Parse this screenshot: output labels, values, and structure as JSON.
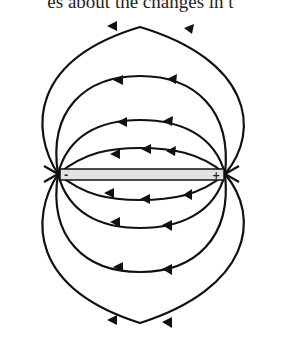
{
  "caption_fragment": "es about the changes in t",
  "diagram": {
    "type": "electric dipole field lines",
    "negative_label": "-",
    "positive_label": "+",
    "colors": {
      "line": "#111111",
      "bar_fill": "#e3e3e3"
    },
    "field_line_loops_above": 4,
    "field_line_loops_below": 4,
    "arrow_direction": "from + to - (leftward)"
  }
}
